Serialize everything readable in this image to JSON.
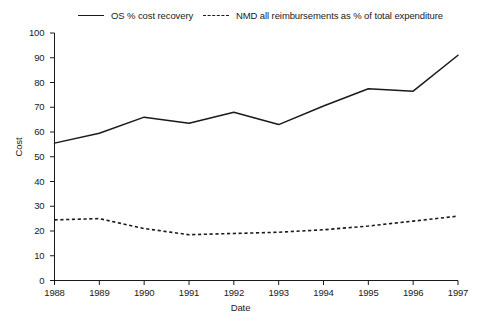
{
  "chart_data": {
    "type": "line",
    "title": "",
    "xlabel": "Date",
    "ylabel": "Cost",
    "x": [
      1988,
      1989,
      1990,
      1991,
      1992,
      1993,
      1994,
      1995,
      1996,
      1997
    ],
    "xticklabels": [
      "1988",
      "1989",
      "1990",
      "1991",
      "1992",
      "1993",
      "1994",
      "1995",
      "1996",
      "1997"
    ],
    "yticks": [
      0,
      10,
      20,
      30,
      40,
      50,
      60,
      70,
      80,
      90,
      100
    ],
    "yticklabels": [
      "0",
      "10",
      "20",
      "30",
      "40",
      "50",
      "60",
      "70",
      "80",
      "90",
      "100"
    ],
    "xlim": [
      1988,
      1997
    ],
    "ylim": [
      0,
      100
    ],
    "grid": false,
    "legend_position": "top",
    "series": [
      {
        "name": "OS % cost recovery",
        "style": "solid",
        "color": "#1a1a1a",
        "values": [
          55.5,
          59.5,
          66.0,
          63.5,
          68.0,
          63.0,
          70.5,
          77.5,
          76.5,
          91.0
        ]
      },
      {
        "name": "NMD all reimbursements as % of total expenditure",
        "style": "dashed",
        "color": "#1a1a1a",
        "values": [
          24.5,
          25.0,
          21.0,
          18.5,
          19.0,
          19.5,
          20.5,
          22.0,
          24.0,
          26.0
        ]
      }
    ]
  }
}
